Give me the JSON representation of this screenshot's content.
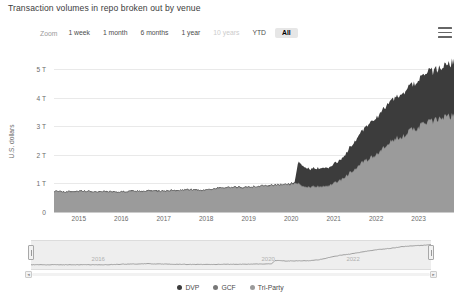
{
  "header": {
    "title": "Transaction volumes in repo broken out by venue",
    "menu_icon": "hamburger-menu-icon"
  },
  "range_selector": {
    "label": "Zoom",
    "buttons": [
      {
        "label": "1 week",
        "state": "enabled"
      },
      {
        "label": "1 month",
        "state": "enabled"
      },
      {
        "label": "6 months",
        "state": "enabled"
      },
      {
        "label": "1 year",
        "state": "enabled"
      },
      {
        "label": "10 years",
        "state": "disabled"
      },
      {
        "label": "YTD",
        "state": "enabled"
      },
      {
        "label": "All",
        "state": "selected"
      }
    ]
  },
  "colors": {
    "dvp": "#3c3c3c",
    "gcf": "#787878",
    "triparty": "#9b9b9b",
    "grid": "#e9e9e9",
    "navigator_band": "#eeeeee",
    "navigator_line": "#8c8c8c"
  },
  "legend": {
    "position": "bottom",
    "items": [
      {
        "label": "DVP",
        "color": "#3c3c3c"
      },
      {
        "label": "GCF",
        "color": "#787878"
      },
      {
        "label": "Tri-Party",
        "color": "#9b9b9b"
      }
    ]
  },
  "navigator": {
    "xlabels": [
      "2016",
      "2020",
      "2022"
    ],
    "left_handle": "navigator-left-handle",
    "right_handle": "navigator-right-handle",
    "scroll_left": "◄",
    "scroll_right": "►"
  },
  "chart_data": {
    "type": "area",
    "title": "Transaction volumes in repo broken out by venue",
    "subtitle": "",
    "xlabel": "",
    "ylabel": "U.S. dollars",
    "stacked": true,
    "grid": true,
    "legend_position": "bottom",
    "ylim": [
      0,
      5600000000000
    ],
    "ytick_labels": [
      "0",
      "1 T",
      "2 T",
      "3 T",
      "4 T",
      "5 T"
    ],
    "ytick_values": [
      0,
      1000000000000,
      2000000000000,
      3000000000000,
      4000000000000,
      5000000000000
    ],
    "xtick_labels": [
      "2015",
      "2016",
      "2017",
      "2018",
      "2019",
      "2020",
      "2021",
      "2022",
      "2023"
    ],
    "xlim": [
      "2014-06",
      "2023-11"
    ],
    "x": [
      "2014-06",
      "2014-09",
      "2014-12",
      "2015-03",
      "2015-06",
      "2015-09",
      "2015-12",
      "2016-03",
      "2016-06",
      "2016-09",
      "2016-12",
      "2017-03",
      "2017-06",
      "2017-09",
      "2017-12",
      "2018-03",
      "2018-06",
      "2018-09",
      "2018-12",
      "2019-03",
      "2019-06",
      "2019-09",
      "2019-12",
      "2020-01",
      "2020-02",
      "2020-03",
      "2020-04",
      "2020-06",
      "2020-09",
      "2020-12",
      "2021-03",
      "2021-06",
      "2021-09",
      "2021-12",
      "2022-03",
      "2022-06",
      "2022-09",
      "2022-12",
      "2023-03",
      "2023-06",
      "2023-09",
      "2023-11"
    ],
    "series": [
      {
        "name": "DVP",
        "color": "#9b9b9b",
        "stack_order": 1,
        "values": [
          700000000000,
          690000000000,
          710000000000,
          700000000000,
          690000000000,
          700000000000,
          680000000000,
          700000000000,
          710000000000,
          720000000000,
          700000000000,
          730000000000,
          750000000000,
          760000000000,
          740000000000,
          800000000000,
          820000000000,
          840000000000,
          830000000000,
          870000000000,
          900000000000,
          930000000000,
          950000000000,
          960000000000,
          970000000000,
          980000000000,
          880000000000,
          860000000000,
          880000000000,
          920000000000,
          1100000000000,
          1400000000000,
          1700000000000,
          1900000000000,
          2200000000000,
          2500000000000,
          2700000000000,
          2900000000000,
          3100000000000,
          3200000000000,
          3300000000000,
          3350000000000
        ]
      },
      {
        "name": "GCF",
        "color": "#787878",
        "stack_order": 2,
        "values": [
          30000000000,
          30000000000,
          30000000000,
          30000000000,
          30000000000,
          30000000000,
          30000000000,
          30000000000,
          30000000000,
          30000000000,
          30000000000,
          30000000000,
          30000000000,
          30000000000,
          30000000000,
          30000000000,
          30000000000,
          30000000000,
          30000000000,
          30000000000,
          30000000000,
          30000000000,
          30000000000,
          30000000000,
          30000000000,
          30000000000,
          30000000000,
          30000000000,
          30000000000,
          30000000000,
          30000000000,
          30000000000,
          30000000000,
          30000000000,
          30000000000,
          30000000000,
          30000000000,
          30000000000,
          30000000000,
          30000000000,
          30000000000,
          30000000000
        ]
      },
      {
        "name": "Tri-Party",
        "color": "#3c3c3c",
        "stack_order": 3,
        "values": [
          0,
          0,
          0,
          0,
          0,
          0,
          0,
          0,
          0,
          0,
          0,
          0,
          0,
          0,
          0,
          0,
          0,
          0,
          0,
          0,
          0,
          0,
          0,
          20000000000,
          30000000000,
          760000000000,
          700000000000,
          620000000000,
          640000000000,
          620000000000,
          700000000000,
          900000000000,
          1100000000000,
          1250000000000,
          1350000000000,
          1450000000000,
          1500000000000,
          1600000000000,
          1700000000000,
          1750000000000,
          1800000000000,
          1850000000000
        ]
      }
    ],
    "navigator_series": {
      "name": "Total",
      "values": [
        730,
        720,
        740,
        730,
        720,
        730,
        710,
        730,
        800,
        870,
        900,
        960,
        900,
        850,
        820,
        800,
        790,
        800,
        810,
        830,
        850,
        880,
        900,
        920,
        940,
        1700,
        1650,
        1580,
        1600,
        1620,
        1800,
        2300,
        2800,
        3100,
        3500,
        3900,
        4200,
        4450,
        4800,
        4950,
        5100,
        5200
      ]
    }
  }
}
